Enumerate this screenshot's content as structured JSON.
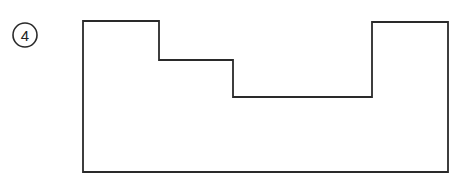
{
  "figure": {
    "label": "4",
    "stroke_color": "#2a2a2a",
    "background": "#ffffff",
    "shape_points": "83,21 159,21 159,60 233,60 233,97 372,97 372,22 448,22 448,172 83,172"
  }
}
